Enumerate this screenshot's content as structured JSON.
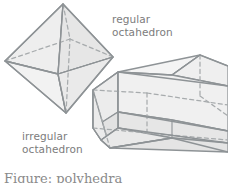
{
  "figure": {
    "kind": "geometry-illustration",
    "background_color": "#ffffff",
    "stroke_color": "#8e9396",
    "dashed_stroke_color": "#a7abad",
    "fill_light": "#f3f3f3",
    "fill_mid": "#ebebeb",
    "fill_dark": "#e2e2e2",
    "text_color": "#7c7c7c"
  },
  "labels": {
    "regular": {
      "line1": "regular",
      "line2": "octahedron"
    },
    "irregular": {
      "line1": "irregular",
      "line2": "octahedron"
    }
  },
  "caption": {
    "text": "Figure: polyhedra"
  },
  "shapes": {
    "regular_octahedron": {
      "name": "regular octahedron",
      "faces_visible": 4,
      "faces_hidden": 4,
      "vertices": {
        "top": [
          63,
          4
        ],
        "bottom": [
          66,
          113
        ],
        "left": [
          5,
          61
        ],
        "right": [
          113,
          57
        ],
        "front": [
          58,
          74
        ],
        "back": [
          70,
          39
        ]
      }
    },
    "irregular_octahedron": {
      "name": "irregular octahedron",
      "description": "elongated hexagonal prism with pyramidal ends",
      "left_apex": [
        91,
        122
      ],
      "right_apex": [
        228,
        80
      ]
    }
  }
}
